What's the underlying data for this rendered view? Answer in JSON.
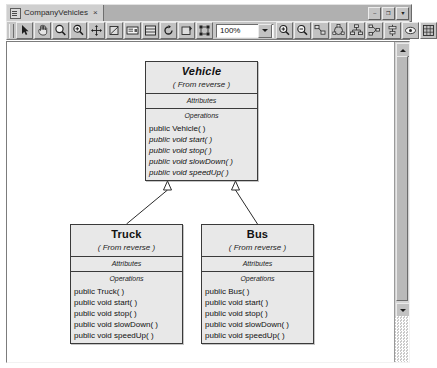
{
  "window": {
    "tab": {
      "label": "CompanyVehicles",
      "icon": "document-icon",
      "close_glyph": "×"
    },
    "controls": [
      {
        "name": "minimize-button",
        "glyph": "–"
      },
      {
        "name": "restore-button",
        "glyph": "❐"
      },
      {
        "name": "close-button",
        "glyph": "▼"
      }
    ]
  },
  "toolbar": {
    "zoom": {
      "value": "100%",
      "dropdown_icon": "chevron-down-icon"
    },
    "left_tools": [
      {
        "name": "select-arrow-tool",
        "icon": "arrow-cursor-icon"
      },
      {
        "name": "pan-hand-tool",
        "icon": "hand-icon"
      },
      {
        "name": "zoom-tool",
        "icon": "magnifier-icon"
      },
      {
        "name": "zoom-selection-tool",
        "icon": "magnifier-plus-icon"
      },
      {
        "name": "move-tool",
        "icon": "four-arrows-icon"
      },
      {
        "name": "edit-shape-tool",
        "icon": "pencil-shape-icon"
      },
      {
        "name": "show-labels-tool",
        "icon": "label-box-icon"
      },
      {
        "name": "class-tool",
        "icon": "class-box-icon"
      },
      {
        "name": "refresh-tool",
        "icon": "refresh-arrows-icon"
      },
      {
        "name": "reverse-engineer-tool",
        "icon": "reverse-arrow-icon"
      },
      {
        "name": "fit-page-tool",
        "icon": "fit-corners-icon"
      }
    ],
    "right_tools": [
      {
        "name": "zoom-in-tool",
        "icon": "magnifier-plus-icon"
      },
      {
        "name": "zoom-out-tool",
        "icon": "magnifier-minus-icon"
      },
      {
        "name": "layout-tool-1",
        "icon": "layout-nodes-icon"
      },
      {
        "name": "layout-tool-2",
        "icon": "layout-circular-icon"
      },
      {
        "name": "layout-tool-3",
        "icon": "layout-tree-icon"
      },
      {
        "name": "layout-tool-4",
        "icon": "layout-hierarchic-icon"
      },
      {
        "name": "align-tool",
        "icon": "align-icon"
      },
      {
        "name": "print-preview-tool",
        "icon": "preview-icon"
      },
      {
        "name": "grid-tool",
        "icon": "grid-icon"
      }
    ]
  },
  "diagram": {
    "section_labels": {
      "attributes": "Attributes",
      "operations": "Operations"
    },
    "classes": [
      {
        "id": "vehicle",
        "name": "Vehicle",
        "abstract": true,
        "stereotype": "( From reverse )",
        "attributes": [],
        "operations": [
          {
            "text": "public Vehicle( )",
            "abstract": false
          },
          {
            "text": "public void  start( )",
            "abstract": true
          },
          {
            "text": "public void  stop( )",
            "abstract": true
          },
          {
            "text": "public void  slowDown( )",
            "abstract": true
          },
          {
            "text": "public void  speedUp( )",
            "abstract": true
          }
        ],
        "x": 138,
        "y": 19,
        "width": 113
      },
      {
        "id": "truck",
        "name": "Truck",
        "abstract": false,
        "stereotype": "( From reverse )",
        "attributes": [],
        "operations": [
          {
            "text": "public Truck( )",
            "abstract": false
          },
          {
            "text": "public void  start( )",
            "abstract": false
          },
          {
            "text": "public void  stop( )",
            "abstract": false
          },
          {
            "text": "public void  slowDown( )",
            "abstract": false
          },
          {
            "text": "public void  speedUp( )",
            "abstract": false
          }
        ],
        "x": 63,
        "y": 182,
        "width": 113
      },
      {
        "id": "bus",
        "name": "Bus",
        "abstract": false,
        "stereotype": "( From reverse )",
        "attributes": [],
        "operations": [
          {
            "text": "public Bus( )",
            "abstract": false
          },
          {
            "text": "public void  start( )",
            "abstract": false
          },
          {
            "text": "public void  stop( )",
            "abstract": false
          },
          {
            "text": "public void  slowDown( )",
            "abstract": false
          },
          {
            "text": "public void  speedUp( )",
            "abstract": false
          }
        ],
        "x": 194,
        "y": 182,
        "width": 113
      }
    ],
    "generalizations": [
      {
        "from": "truck",
        "to": "vehicle",
        "name": "generalization-truck-vehicle"
      },
      {
        "from": "bus",
        "to": "vehicle",
        "name": "generalization-bus-vehicle"
      }
    ]
  },
  "scrollbars": {
    "vertical": {
      "up_arrow": "▲",
      "down_arrow": "▼"
    }
  },
  "colors": {
    "class_fill": "#e8e8e8",
    "class_border": "#3a3a3a",
    "toolbar": "#c6c6c6",
    "canvas": "#ffffff"
  }
}
